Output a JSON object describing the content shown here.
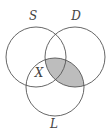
{
  "diagram": {
    "type": "venn",
    "sets": [
      {
        "id": "S",
        "label": "S",
        "cx": 36,
        "cy": 57,
        "r": 30
      },
      {
        "id": "D",
        "label": "D",
        "cx": 75,
        "cy": 57,
        "r": 30
      },
      {
        "id": "L",
        "label": "L",
        "cx": 55,
        "cy": 87,
        "r": 29
      }
    ],
    "region_label": {
      "text": "X",
      "region": "S∩L only"
    },
    "shaded_region": "D∩L",
    "colors": {
      "stroke": "#555555",
      "shade": "#bdbdbd",
      "background": "#ffffff"
    }
  }
}
